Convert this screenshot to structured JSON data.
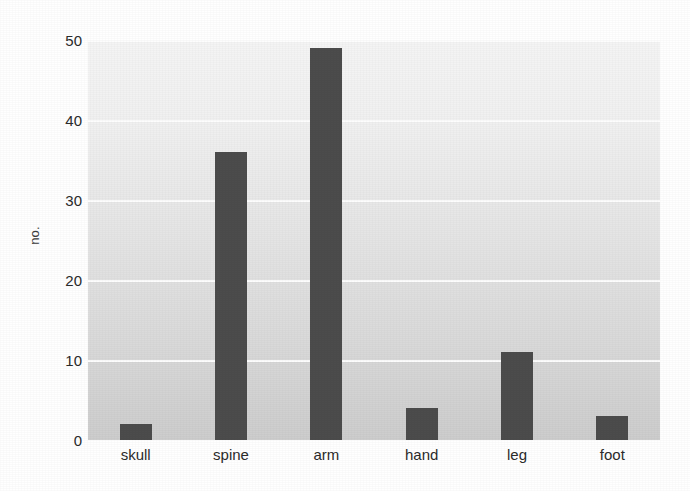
{
  "chart_data": {
    "type": "bar",
    "title": "",
    "subtitle": "",
    "xlabel": "",
    "ylabel": "no.",
    "categories": [
      "skull",
      "spine",
      "arm",
      "hand",
      "leg",
      "foot"
    ],
    "values": [
      2,
      36,
      49,
      4,
      11,
      3
    ],
    "series": [
      {
        "name": "no.",
        "values": [
          2,
          36,
          49,
          4,
          11,
          3
        ]
      }
    ],
    "ylim": [
      0,
      50
    ],
    "y_ticks": [
      0,
      10,
      20,
      30,
      40,
      50
    ],
    "y_tick_labels": [
      "0",
      "10",
      "20",
      "30",
      "40",
      "50"
    ],
    "x_tick_labels": [
      "skull",
      "spine",
      "arm",
      "hand",
      "leg",
      "foot"
    ],
    "grid": true,
    "grid_axis": "y",
    "grid_color": "#ffffff",
    "legend": false,
    "legend_position": "none",
    "bar_color": "#4c4c4c",
    "plot_background_top": "#f4f4f4",
    "plot_background_bottom": "#cdcdcd",
    "figure_background": "#ffffff",
    "annotations": []
  },
  "axes": {
    "y_label_text": "no.",
    "y_ticks": [
      {
        "label": "50",
        "value": 50
      },
      {
        "label": "40",
        "value": 40
      },
      {
        "label": "30",
        "value": 30
      },
      {
        "label": "20",
        "value": 20
      },
      {
        "label": "10",
        "value": 10
      },
      {
        "label": "0",
        "value": 0
      }
    ],
    "x_ticks": [
      {
        "label": "skull",
        "value": 2
      },
      {
        "label": "spine",
        "value": 36
      },
      {
        "label": "arm",
        "value": 49
      },
      {
        "label": "hand",
        "value": 4
      },
      {
        "label": "leg",
        "value": 11
      },
      {
        "label": "foot",
        "value": 3
      }
    ]
  }
}
